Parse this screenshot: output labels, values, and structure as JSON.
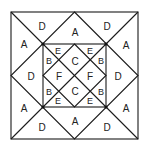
{
  "diagram": {
    "title": "",
    "outer_labels": {
      "top_left_upper": "D",
      "top_left_lower": "A",
      "top_center": "A",
      "top_right_upper": "D",
      "top_right_lower": "A",
      "left_center": "D",
      "right_center": "D",
      "bottom_left_upper": "A",
      "bottom_left_lower": "D",
      "bottom_center": "A",
      "bottom_right_upper": "A",
      "bottom_right_lower": "D"
    },
    "inner_labels": {
      "e_top_left": "E",
      "e_top_right": "E",
      "e_bottom_left": "E",
      "e_bottom_right": "E",
      "b_top_left": "B",
      "b_top_right": "B",
      "b_bottom_left": "B",
      "b_bottom_right": "B",
      "c_top": "C",
      "c_bottom": "C",
      "f_left": "F",
      "f_right": "F"
    }
  }
}
